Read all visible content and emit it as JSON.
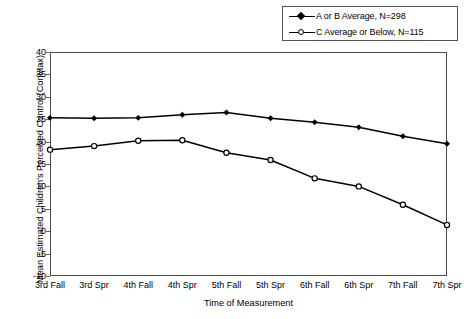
{
  "chart_data": {
    "type": "line",
    "title": "",
    "xlabel": "Time of Measurement",
    "ylabel": "Mean Estimated Children's Perceived Control (ConMax)",
    "categories": [
      "3rd Fall",
      "3rd Spr",
      "4th Fall",
      "4th Spr",
      "5th Fall",
      "5th Spr",
      "6th Fall",
      "6th Spr",
      "7th Fall",
      "7th Spr"
    ],
    "ylim": [
      -10,
      40
    ],
    "yticks": [
      40,
      35,
      30,
      25,
      20,
      15,
      10,
      5,
      0,
      -5,
      -10
    ],
    "grid": false,
    "legend_position": "top-right",
    "series": [
      {
        "name": "A or B Average, N=298",
        "marker": "filled-diamond",
        "values": [
          25.3,
          25.2,
          25.3,
          26.0,
          26.5,
          25.2,
          24.3,
          23.2,
          21.2,
          19.5
        ]
      },
      {
        "name": "C Average or Below, N=115",
        "marker": "open-circle",
        "values": [
          18.2,
          19.0,
          20.2,
          20.3,
          17.5,
          15.9,
          11.8,
          10.0,
          5.9,
          1.4
        ]
      }
    ]
  },
  "legend": {
    "entries": [
      {
        "label": "A or B Average, N=298",
        "marker": "filled-diamond"
      },
      {
        "label": "C Average or Below, N=115",
        "marker": "open-circle"
      }
    ]
  },
  "colors": {
    "series_line": "#000000",
    "axis": "#4a4a4a",
    "text": "#000000",
    "background": "#ffffff"
  }
}
